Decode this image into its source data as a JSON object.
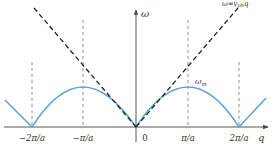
{
  "diagram": {
    "axes": {
      "x_label": "q",
      "y_label": "ω",
      "ticks": [
        "−2π/a",
        "−π/a",
        "0",
        "π/a",
        "2π/a"
      ]
    },
    "annotations": {
      "asymptote": "ω=v",
      "asymptote_sub": "ph",
      "asymptote_tail": "q",
      "max_label": "ω",
      "max_sub": "m"
    },
    "colors": {
      "curve": "#5ba3d6",
      "asymptote": "#222222",
      "axis": "#444444",
      "guides": "#777777"
    }
  }
}
